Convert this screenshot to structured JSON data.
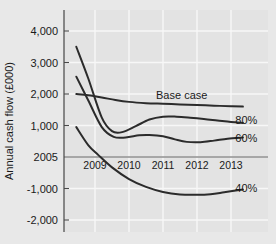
{
  "chart_data": {
    "type": "line",
    "title": "",
    "xlabel": "",
    "ylabel": "Annual cash flow (£000)",
    "x_tick_labels": [
      "2005",
      "2009",
      "2010",
      "2011",
      "2012",
      "2013"
    ],
    "y_tick_labels": [
      "4,000",
      "3,000",
      "2,000",
      "1,000",
      "",
      "-1,000",
      "-2,000"
    ],
    "y_tick_values": [
      4000,
      3000,
      2000,
      1000,
      0,
      -1000,
      -2000
    ],
    "ylim": [
      -2000,
      4000
    ],
    "xlim": [
      2008.4,
      2013.85
    ],
    "grid": true,
    "legend_position": "inline-right",
    "zero_line": true,
    "origin_label": "2005",
    "series": [
      {
        "name": "Base case",
        "label": "Base case",
        "label_x": 2011.55,
        "label_y": 1960,
        "x": [
          2008.45,
          2008.8,
          2009.2,
          2009.6,
          2010.0,
          2010.5,
          2011.0,
          2011.5,
          2012.0,
          2012.5,
          2013.0,
          2013.35
        ],
        "y": [
          2000,
          1960,
          1890,
          1810,
          1750,
          1710,
          1690,
          1670,
          1650,
          1630,
          1610,
          1600
        ]
      },
      {
        "name": "80%",
        "label": "80%",
        "label_x": 2013.45,
        "label_y": 1180,
        "x": [
          2008.45,
          2008.8,
          2009.2,
          2009.5,
          2009.8,
          2010.2,
          2010.6,
          2011.0,
          2011.4,
          2011.8,
          2012.2,
          2012.6,
          2013.0,
          2013.35
        ],
        "y": [
          3500,
          2500,
          1250,
          820,
          790,
          980,
          1190,
          1280,
          1280,
          1250,
          1210,
          1160,
          1110,
          1080
        ]
      },
      {
        "name": "60%",
        "label": "60%",
        "label_x": 2013.45,
        "label_y": 600,
        "x": [
          2008.45,
          2008.8,
          2009.2,
          2009.55,
          2009.9,
          2010.3,
          2010.6,
          2011.0,
          2011.35,
          2011.7,
          2012.1,
          2012.5,
          2012.9,
          2013.35
        ],
        "y": [
          2550,
          1800,
          950,
          640,
          620,
          690,
          700,
          660,
          560,
          480,
          470,
          520,
          580,
          620
        ]
      },
      {
        "name": "40%",
        "label": "40%",
        "label_x": 2013.45,
        "label_y": -980,
        "x": [
          2008.45,
          2008.8,
          2009.1,
          2009.5,
          2010.0,
          2010.5,
          2011.0,
          2011.5,
          2012.0,
          2012.4,
          2012.8,
          2013.35
        ],
        "y": [
          950,
          380,
          60,
          -330,
          -700,
          -950,
          -1110,
          -1190,
          -1200,
          -1180,
          -1120,
          -1030
        ]
      }
    ]
  },
  "colors": {
    "plot_background": "#e3e3e3",
    "page_background": "#e8e8e8",
    "gridline": "#f7f7f7",
    "axis": "#6e6e6e",
    "series_stroke": "#2b2b2b",
    "text": "#1a1a1a"
  }
}
